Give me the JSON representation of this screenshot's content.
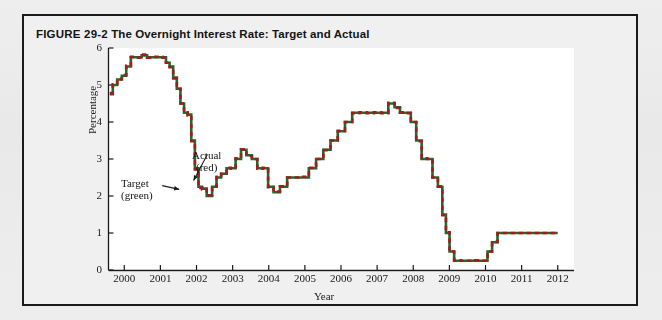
{
  "figure": {
    "number": "FIGURE 29-2",
    "title": "The Overnight Interest Rate: Target and Actual"
  },
  "annotations": {
    "target_line1": "Target",
    "target_line2": "(green)",
    "actual_line1": "Actual",
    "actual_line2": "(red)"
  },
  "colors": {
    "frame": "#1b1b1b",
    "page_background": "#ececec",
    "figure_background": "#f0f0f0",
    "plot_background": "#ffffff",
    "target_series": "#1d6b2e",
    "actual_series": "#a31b1b",
    "axis": "#1a1a1a"
  },
  "chart_data": {
    "type": "line",
    "title": "The Overnight Interest Rate: Target and Actual",
    "xlabel": "Year",
    "ylabel": "Percentage",
    "xlim": [
      1999.55,
      2012.45
    ],
    "ylim": [
      0,
      6
    ],
    "yticks": [
      0,
      1,
      2,
      3,
      4,
      5,
      6
    ],
    "ytick_labels": [
      "0",
      "1",
      "2",
      "3",
      "4",
      "5",
      "6"
    ],
    "xticks": [
      2000,
      2001,
      2002,
      2003,
      2004,
      2005,
      2006,
      2007,
      2008,
      2009,
      2010,
      2011,
      2012
    ],
    "xtick_labels": [
      "2000",
      "2001",
      "2002",
      "2003",
      "2004",
      "2005",
      "2006",
      "2007",
      "2008",
      "2009",
      "2010",
      "2011",
      "2012"
    ],
    "grid": false,
    "legend": "inline-annotations",
    "series": [
      {
        "name": "Target (green)",
        "color": "#1d6b2e",
        "style": "solid",
        "x": [
          1999.6,
          1999.75,
          1999.85,
          2000.0,
          2000.1,
          2000.25,
          2000.4,
          2000.55,
          2000.7,
          2000.85,
          2001.0,
          2001.1,
          2001.2,
          2001.3,
          2001.4,
          2001.5,
          2001.6,
          2001.7,
          2001.8,
          2001.9,
          2002.0,
          2002.1,
          2002.2,
          2002.35,
          2002.5,
          2002.6,
          2002.75,
          2002.9,
          2003.0,
          2003.15,
          2003.3,
          2003.45,
          2003.6,
          2003.75,
          2003.9,
          2004.05,
          2004.2,
          2004.4,
          2004.6,
          2004.8,
          2005.0,
          2005.2,
          2005.4,
          2005.6,
          2005.8,
          2006.0,
          2006.2,
          2006.4,
          2006.6,
          2006.8,
          2007.0,
          2007.2,
          2007.4,
          2007.55,
          2007.7,
          2007.85,
          2008.0,
          2008.15,
          2008.3,
          2008.45,
          2008.6,
          2008.75,
          2008.85,
          2008.95,
          2009.05,
          2009.2,
          2009.4,
          2009.6,
          2009.8,
          2010.0,
          2010.1,
          2010.25,
          2010.4,
          2010.55,
          2010.7,
          2010.9,
          2011.2,
          2011.6,
          2012.0
        ],
        "y": [
          4.75,
          5.0,
          5.15,
          5.25,
          5.5,
          5.75,
          5.75,
          5.8,
          5.75,
          5.75,
          5.75,
          5.75,
          5.6,
          5.5,
          5.2,
          4.9,
          4.5,
          4.25,
          4.2,
          3.5,
          2.75,
          2.25,
          2.2,
          2.0,
          2.25,
          2.5,
          2.6,
          2.75,
          2.75,
          3.0,
          3.25,
          3.1,
          3.0,
          2.75,
          2.75,
          2.25,
          2.1,
          2.25,
          2.5,
          2.5,
          2.5,
          2.75,
          3.0,
          3.25,
          3.5,
          3.75,
          4.0,
          4.25,
          4.25,
          4.25,
          4.25,
          4.25,
          4.5,
          4.4,
          4.25,
          4.25,
          4.0,
          3.5,
          3.0,
          3.0,
          2.5,
          2.25,
          1.5,
          1.0,
          0.5,
          0.25,
          0.25,
          0.25,
          0.25,
          0.25,
          0.5,
          0.75,
          1.0,
          1.0,
          1.0,
          1.0,
          1.0,
          1.0,
          1.0
        ]
      },
      {
        "name": "Actual (red)",
        "color": "#a31b1b",
        "style": "dashed-overlay",
        "x": [
          1999.6,
          1999.75,
          1999.85,
          2000.0,
          2000.1,
          2000.25,
          2000.4,
          2000.55,
          2000.7,
          2000.85,
          2001.0,
          2001.1,
          2001.2,
          2001.3,
          2001.4,
          2001.5,
          2001.6,
          2001.7,
          2001.8,
          2001.9,
          2002.0,
          2002.1,
          2002.2,
          2002.35,
          2002.5,
          2002.6,
          2002.75,
          2002.9,
          2003.0,
          2003.15,
          2003.3,
          2003.45,
          2003.6,
          2003.75,
          2003.9,
          2004.05,
          2004.2,
          2004.4,
          2004.6,
          2004.8,
          2005.0,
          2005.2,
          2005.4,
          2005.6,
          2005.8,
          2006.0,
          2006.2,
          2006.4,
          2006.6,
          2006.8,
          2007.0,
          2007.2,
          2007.4,
          2007.55,
          2007.7,
          2007.85,
          2008.0,
          2008.15,
          2008.3,
          2008.45,
          2008.6,
          2008.75,
          2008.85,
          2008.95,
          2009.05,
          2009.2,
          2009.4,
          2009.6,
          2009.8,
          2010.0,
          2010.1,
          2010.25,
          2010.4,
          2010.55,
          2010.7,
          2010.9,
          2011.2,
          2011.6,
          2012.0
        ],
        "y": [
          4.78,
          5.02,
          5.16,
          5.27,
          5.52,
          5.76,
          5.74,
          5.82,
          5.74,
          5.76,
          5.76,
          5.74,
          5.6,
          5.48,
          5.18,
          4.9,
          4.5,
          4.26,
          4.18,
          3.48,
          2.72,
          2.22,
          2.18,
          2.02,
          2.26,
          2.52,
          2.6,
          2.76,
          2.74,
          3.02,
          3.26,
          3.08,
          3.0,
          2.74,
          2.76,
          2.24,
          2.12,
          2.26,
          2.5,
          2.5,
          2.52,
          2.76,
          3.0,
          3.24,
          3.5,
          3.76,
          4.0,
          4.24,
          4.26,
          4.24,
          4.26,
          4.24,
          4.52,
          4.38,
          4.26,
          4.24,
          4.0,
          3.48,
          3.02,
          3.0,
          2.5,
          2.26,
          1.48,
          1.02,
          0.5,
          0.26,
          0.25,
          0.25,
          0.26,
          0.25,
          0.5,
          0.76,
          1.0,
          1.0,
          1.0,
          1.0,
          1.0,
          1.0,
          1.0
        ]
      }
    ],
    "annotations": [
      {
        "text": "Target (green)",
        "x": 2000.9,
        "y": 2.55,
        "arrow_to_x": 2001.45,
        "arrow_to_y": 2.28
      },
      {
        "text": "Actual (red)",
        "x": 2002.45,
        "y": 3.35,
        "arrow_to_x": 2001.95,
        "arrow_to_y": 2.42
      }
    ]
  }
}
